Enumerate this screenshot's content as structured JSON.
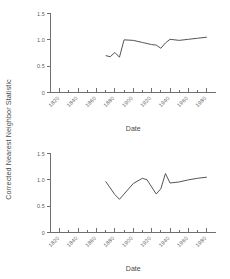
{
  "figure": {
    "background": "#ffffff",
    "line_color": "#555555",
    "axis_color": "#6f6f6f",
    "text_color": "#4a4a4a",
    "shared_ylabel": "Corrected Nearest Neighbor Statistic"
  },
  "chart_data": [
    {
      "type": "line",
      "panel": "top",
      "title": "",
      "xlabel": "Date",
      "ylabel": "Corrected Nearest Neighbor Statistic",
      "xlim": [
        1810,
        1990
      ],
      "ylim": [
        0,
        1.5
      ],
      "grid": false,
      "legend": "none",
      "xticks": [
        1820,
        1840,
        1860,
        1880,
        1900,
        1920,
        1940,
        1960,
        1980
      ],
      "xtick_labels": [
        "1820",
        "1840",
        "1860",
        "1880",
        "1900",
        "1920",
        "1940",
        "1960",
        "1980"
      ],
      "minor_xticks": [
        1830,
        1850,
        1870,
        1890,
        1910,
        1930,
        1950,
        1970
      ],
      "yticks": [
        0,
        0.5,
        1.0,
        1.5
      ],
      "ytick_labels": [
        "0",
        "0.5",
        "1.0",
        "1.5"
      ],
      "series": [
        {
          "name": "corrected nearest neighbor statistic",
          "x": [
            1870,
            1875,
            1880,
            1885,
            1890,
            1900,
            1910,
            1920,
            1925,
            1930,
            1935,
            1940,
            1950,
            1960,
            1970,
            1980
          ],
          "values": [
            0.7,
            0.68,
            0.76,
            0.67,
            1.0,
            0.99,
            0.95,
            0.91,
            0.9,
            0.84,
            0.94,
            1.01,
            0.99,
            1.01,
            1.03,
            1.05
          ]
        }
      ]
    },
    {
      "type": "line",
      "panel": "bottom",
      "title": "",
      "xlabel": "Date",
      "ylabel": "Corrected Nearest Neighbor Statistic",
      "xlim": [
        1810,
        1990
      ],
      "ylim": [
        0,
        1.5
      ],
      "grid": false,
      "legend": "none",
      "xticks": [
        1820,
        1840,
        1860,
        1880,
        1900,
        1920,
        1940,
        1960,
        1980
      ],
      "xtick_labels": [
        "1820",
        "1840",
        "1860",
        "1880",
        "1900",
        "1920",
        "1940",
        "1960",
        "1980"
      ],
      "minor_xticks": [
        1830,
        1850,
        1870,
        1890,
        1910,
        1930,
        1950,
        1970
      ],
      "yticks": [
        0,
        0.5,
        1.0,
        1.5
      ],
      "ytick_labels": [
        "0",
        "0.5",
        "1.0",
        "1.5"
      ],
      "series": [
        {
          "name": "corrected nearest neighbor statistic",
          "x": [
            1870,
            1880,
            1885,
            1900,
            1910,
            1915,
            1925,
            1930,
            1935,
            1940,
            1950,
            1960,
            1970,
            1980
          ],
          "values": [
            0.97,
            0.72,
            0.63,
            0.93,
            1.03,
            1.0,
            0.73,
            0.83,
            1.12,
            0.94,
            0.96,
            1.0,
            1.03,
            1.05
          ]
        }
      ]
    }
  ],
  "labels": {
    "xaxis_title_top": "Date",
    "xaxis_title_bottom": "Date"
  }
}
